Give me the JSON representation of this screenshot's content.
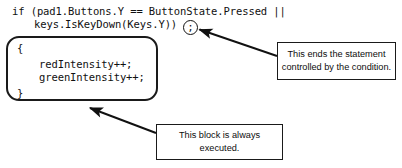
{
  "figure": {
    "type": "annotated-code-figure",
    "background_color": "#ffffff",
    "ink_color": "#1a1a1a"
  },
  "code": {
    "language": "csharp",
    "lines": [
      "if (pad1.Buttons.Y == ButtonState.Pressed ||",
      "keys.IsKeyDown(Keys.Y))",
      "{",
      "redIntensity++;",
      "greenIntensity++;",
      "}"
    ],
    "line1": "if (pad1.Buttons.Y == ButtonState.Pressed ||",
    "line2": "keys.IsKeyDown(Keys.Y))",
    "line3": "{",
    "line4": "redIntensity++;",
    "line5": "greenIntensity++;",
    "line6": "}"
  },
  "highlights": {
    "semicolon_circle": {
      "glyph": ";",
      "shape": "circle",
      "target": "statement-terminator"
    },
    "block_outline": {
      "shape": "rounded-rectangle",
      "target": "if-statement-body-block"
    }
  },
  "callouts": [
    {
      "id": "statement-end",
      "line1": "This ends the statement",
      "line2": "controlled by the condition.",
      "points_to": "semicolon-circle"
    },
    {
      "id": "block-always-executed",
      "line1": "This block is always",
      "line2": "executed.",
      "points_to": "block-outline"
    }
  ],
  "callout_statement": {
    "line1": "This ends the statement",
    "line2": "controlled by the condition."
  },
  "callout_block": {
    "line1": "This block is always",
    "line2": "executed."
  }
}
